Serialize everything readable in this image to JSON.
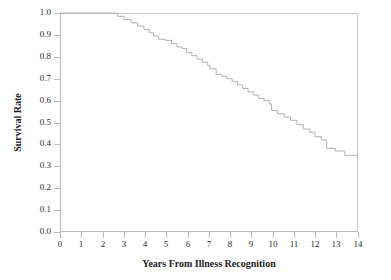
{
  "chart_data": {
    "type": "line",
    "subtype": "kaplan-meier-step",
    "title": "",
    "xlabel": "Years From Illness Recognition",
    "ylabel": "Survival Rate",
    "xlim": [
      0,
      14
    ],
    "ylim": [
      0.0,
      1.0
    ],
    "grid": false,
    "legend": null,
    "line_color": "#b0b0b0",
    "axis_color": "#b9b9b9",
    "text_color": "#2b2b2b",
    "xticks": [
      0,
      1,
      2,
      3,
      4,
      5,
      6,
      7,
      8,
      9,
      10,
      11,
      12,
      13,
      14
    ],
    "xtick_labels": [
      "0",
      "1",
      "2",
      "3",
      "4",
      "5",
      "6",
      "7",
      "8",
      "9",
      "10",
      "11",
      "12",
      "13",
      "14"
    ],
    "yticks": [
      0.0,
      0.1,
      0.2,
      0.3,
      0.4,
      0.5,
      0.6,
      0.7,
      0.8,
      0.9,
      1.0
    ],
    "ytick_labels": [
      "0.0",
      "0.1",
      "0.2",
      "0.3",
      "0.4",
      "0.5",
      "0.6",
      "0.7",
      "0.8",
      "0.9",
      "1.0"
    ],
    "series": [
      {
        "name": "Survival",
        "x": [
          0.0,
          2.45,
          2.7,
          3.0,
          3.35,
          3.65,
          3.95,
          4.2,
          4.4,
          4.65,
          4.95,
          5.25,
          5.5,
          5.75,
          5.95,
          6.2,
          6.45,
          6.7,
          6.95,
          7.05,
          7.35,
          7.6,
          7.85,
          8.1,
          8.35,
          8.6,
          8.85,
          9.1,
          9.35,
          9.6,
          9.85,
          9.95,
          10.25,
          10.55,
          10.85,
          11.15,
          11.45,
          11.75,
          12.0,
          12.3,
          12.55,
          12.95,
          13.4,
          14.0,
          14.0
        ],
        "y": [
          1.0,
          1.0,
          0.985,
          0.97,
          0.955,
          0.94,
          0.925,
          0.91,
          0.895,
          0.88,
          0.875,
          0.86,
          0.845,
          0.838,
          0.82,
          0.805,
          0.79,
          0.775,
          0.76,
          0.745,
          0.72,
          0.712,
          0.7,
          0.688,
          0.672,
          0.655,
          0.64,
          0.625,
          0.61,
          0.6,
          0.585,
          0.555,
          0.54,
          0.525,
          0.51,
          0.49,
          0.47,
          0.455,
          0.435,
          0.42,
          0.382,
          0.37,
          0.35,
          0.34,
          0.33
        ],
        "final_value": 0.33,
        "start_value": 1.0,
        "first_event_year": 2.45
      }
    ]
  },
  "axis": {
    "x_title": "Years From Illness Recognition",
    "y_title": "Survival Rate"
  }
}
